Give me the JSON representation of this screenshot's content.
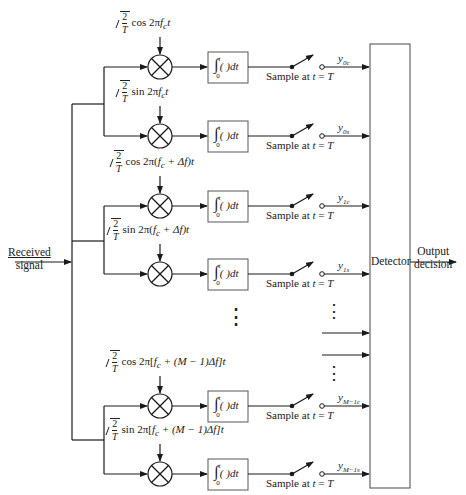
{
  "input": {
    "label_line1": "Received",
    "label_line2": "signal"
  },
  "output": {
    "label_line1": "Output",
    "label_line2": "decision"
  },
  "detector": {
    "label": "Detector"
  },
  "integrator": {
    "symbol": "∫",
    "upper": "t",
    "lower": "0",
    "body": "( )dt"
  },
  "sampler": {
    "text_prefix": "Sample at ",
    "t": "t",
    "eq": " = ",
    "T": "T"
  },
  "branches": [
    {
      "id": "0c",
      "y": 67,
      "ref_pre": "cos 2π",
      "ref_arg": "f",
      "ref_sub": "c",
      "ref_post": "t",
      "out": "y",
      "out_sub": "0c",
      "ref_full": "√(2/T) cos 2πf_c t"
    },
    {
      "id": "0s",
      "y": 136,
      "ref_pre": "sin 2π",
      "ref_arg": "f",
      "ref_sub": "c",
      "ref_post": "t",
      "out": "y",
      "out_sub": "0s",
      "ref_full": "√(2/T) sin 2πf_c t"
    },
    {
      "id": "1c",
      "y": 206,
      "ref_pre": "cos 2π(",
      "ref_arg": "f",
      "ref_sub": "c",
      "ref_post": " + Δf)t",
      "out": "y",
      "out_sub": "1c",
      "ref_full": "√(2/T) cos 2π(f_c + Δf)t"
    },
    {
      "id": "1s",
      "y": 274,
      "ref_pre": "sin 2π(",
      "ref_arg": "f",
      "ref_sub": "c",
      "ref_post": " + Δf)t",
      "out": "y",
      "out_sub": "1s",
      "ref_full": "√(2/T) sin 2π(f_c + Δf)t"
    },
    {
      "id": "M-1c",
      "y": 406,
      "ref_pre": "cos 2π[",
      "ref_arg": "f",
      "ref_sub": "c",
      "ref_post": " + (M − 1)Δf]t",
      "out": "y",
      "out_sub": "M−1c",
      "ref_full": "√(2/T) cos 2π[f_c + (M − 1)Δf]t"
    },
    {
      "id": "M-1s",
      "y": 474,
      "ref_pre": "sin 2π[",
      "ref_arg": "f",
      "ref_sub": "c",
      "ref_post": " + (M − 1)Δf]t",
      "out": "y",
      "out_sub": "M−1s",
      "ref_full": "√(2/T) sin 2π[f_c + (M − 1)Δf]t"
    }
  ],
  "sqrt_frac": {
    "num": "2",
    "den": "T"
  },
  "ellipsis": "⋮",
  "colors": {
    "line": "#1a1a1a",
    "box": "#555555",
    "bg": "#ffffff"
  }
}
